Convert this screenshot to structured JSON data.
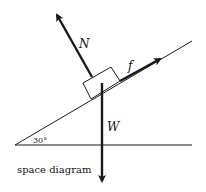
{
  "diagram": {
    "caption": "space diagram",
    "angle_label": "30°",
    "forces": {
      "normal": {
        "label": "N"
      },
      "friction": {
        "label": "f"
      },
      "weight": {
        "label": "W"
      }
    },
    "colors": {
      "line": "#1a1a1a",
      "background": "#ffffff"
    }
  }
}
